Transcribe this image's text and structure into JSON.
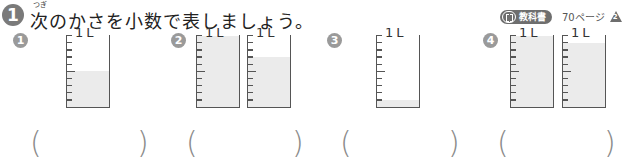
{
  "problem": {
    "number": "1",
    "furigana": "つぎ",
    "title": "次のかさを小数で表しましょう。"
  },
  "reference": {
    "icon": "book-icon",
    "badge_label": "教科書",
    "page": "70ページ",
    "section_marker": "2"
  },
  "questions": [
    {
      "number": "1",
      "beakers": [
        {
          "label": "1L",
          "fill": 0.5
        }
      ],
      "answer": ""
    },
    {
      "number": "2",
      "beakers": [
        {
          "label": "1L",
          "fill": 1.0
        },
        {
          "label": "1L",
          "fill": 0.7
        }
      ],
      "answer": ""
    },
    {
      "number": "3",
      "beakers": [
        {
          "label": "1L",
          "fill": 0.1
        }
      ],
      "answer": ""
    },
    {
      "number": "4",
      "beakers": [
        {
          "label": "1L",
          "fill": 1.0
        },
        {
          "label": "1L",
          "fill": 0.9
        }
      ],
      "answer": ""
    }
  ],
  "paren_open": "(",
  "paren_close": ")",
  "colors": {
    "badge_gray": "#7a7a7a",
    "fill_gray": "#ebebeb",
    "line": "#555555"
  }
}
